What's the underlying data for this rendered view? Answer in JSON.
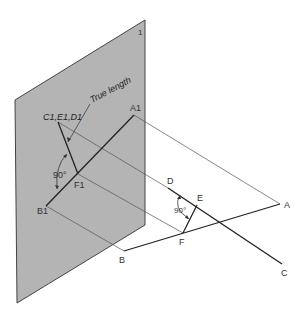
{
  "diagram": {
    "title": "",
    "plane": {
      "label": "1",
      "fill": "#b4b4b4",
      "stroke": "#444444",
      "points": [
        [
          15,
          100
        ],
        [
          145,
          20
        ],
        [
          145,
          225
        ],
        [
          17,
          303
        ]
      ]
    },
    "labels": {
      "plane_number": "1",
      "c1e1d1": "C1,E1,D1",
      "true_length": "True length",
      "a1": "A1",
      "b1": "B1",
      "f1": "F1",
      "angle_plane": "90°",
      "angle_space": "90°",
      "a": "A",
      "b": "B",
      "c": "C",
      "d": "D",
      "e": "E",
      "f": "F"
    },
    "points": {
      "A1": [
        134,
        115
      ],
      "B1": [
        46,
        206
      ],
      "F1": [
        78,
        174
      ],
      "CED1": [
        58,
        122
      ],
      "A": [
        280,
        204
      ],
      "B": [
        124,
        251
      ],
      "C": [
        282,
        264
      ],
      "D": [
        168,
        188
      ],
      "E": [
        197,
        205
      ],
      "F": [
        183,
        233
      ]
    },
    "colors": {
      "line": "#222222",
      "projector": "#555555",
      "plane_fill": "#b4b4b4"
    }
  }
}
